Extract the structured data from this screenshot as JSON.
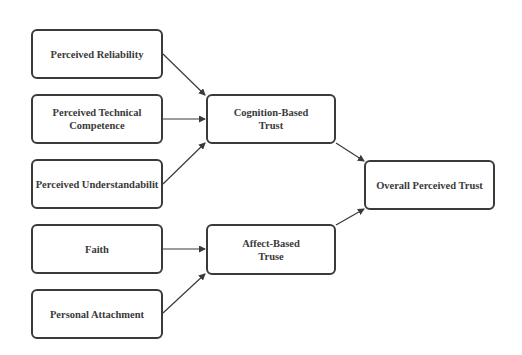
{
  "diagram": {
    "type": "flowchart",
    "colors": {
      "stroke": "#3a3a3a",
      "text": "#3a3a3a",
      "background": "#ffffff"
    },
    "nodes": {
      "reliability": {
        "label": "Perceived Reliability"
      },
      "competence": {
        "label": "Perceived Technical\nCompetence"
      },
      "understandability": {
        "label": "Perceived Understandabilit"
      },
      "faith": {
        "label": "Faith"
      },
      "attachment": {
        "label": "Personal Attachment"
      },
      "cognition": {
        "label": "Cognition-Based\nTrust"
      },
      "affect": {
        "label": "Affect-Based\nTruse"
      },
      "overall": {
        "label": "Overall Perceived Trust"
      }
    },
    "edges": [
      {
        "from": "Perceived Reliability",
        "to": "Cognition-Based Trust"
      },
      {
        "from": "Perceived Technical Competence",
        "to": "Cognition-Based Trust"
      },
      {
        "from": "Perceived Understandabilit",
        "to": "Cognition-Based Trust"
      },
      {
        "from": "Faith",
        "to": "Affect-Based Truse"
      },
      {
        "from": "Personal Attachment",
        "to": "Affect-Based Truse"
      },
      {
        "from": "Cognition-Based Trust",
        "to": "Overall Perceived Trust"
      },
      {
        "from": "Affect-Based Truse",
        "to": "Overall Perceived Trust"
      }
    ]
  }
}
